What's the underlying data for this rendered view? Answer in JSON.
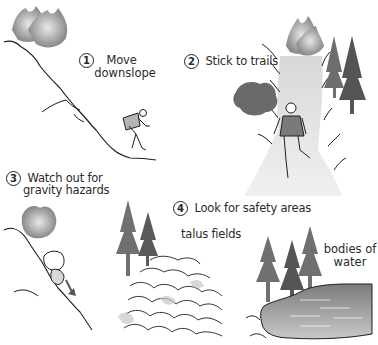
{
  "steps": [
    {
      "number": "1",
      "line1": "Move",
      "line2": "downslope"
    },
    {
      "number": "2",
      "line1": "Stick to trails"
    },
    {
      "number": "3",
      "line1": "Watch out for",
      "line2": "gravity hazards"
    },
    {
      "number": "4",
      "line1": "Look for safety areas"
    }
  ],
  "safety_areas": [
    {
      "label": "talus fields"
    },
    {
      "label_line1": "bodies of",
      "label_line2": "water"
    }
  ],
  "colors": {
    "line": "#1e1e1e",
    "smoke": "#a8a8a8",
    "tree": "#6e6e6e",
    "water": "#9a9a9a",
    "background": "#ffffff"
  }
}
